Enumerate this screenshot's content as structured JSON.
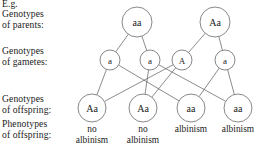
{
  "labels": {
    "eg": "E.g.",
    "parents": "Genotypes\nof parents:",
    "gametes": "Genotypes\nof gametes:",
    "offspring_genotypes": "Genotypes\nof offspring:",
    "offspring_phenotypes": "Phenotypes\nof offspring:"
  },
  "diagram": {
    "parents": [
      {
        "genotype": "aa",
        "cx": 137,
        "cy": 22,
        "r": 15
      },
      {
        "genotype": "Aa",
        "cx": 215,
        "cy": 22,
        "r": 15
      }
    ],
    "gametes": [
      {
        "allele": "a",
        "cx": 110,
        "cy": 60,
        "r": 10
      },
      {
        "allele": "a",
        "cx": 150,
        "cy": 60,
        "r": 10
      },
      {
        "allele": "A",
        "cx": 182,
        "cy": 60,
        "r": 10
      },
      {
        "allele": "a",
        "cx": 225,
        "cy": 60,
        "r": 10
      }
    ],
    "offspring": [
      {
        "genotype": "Aa",
        "cx": 92,
        "cy": 108,
        "r": 14
      },
      {
        "genotype": "Aa",
        "cx": 143,
        "cy": 108,
        "r": 14
      },
      {
        "genotype": "aa",
        "cx": 191,
        "cy": 108,
        "r": 14
      },
      {
        "genotype": "aa",
        "cx": 238,
        "cy": 108,
        "r": 14
      }
    ],
    "parent_to_gamete": [
      {
        "from": 0,
        "to": 0
      },
      {
        "from": 0,
        "to": 1
      },
      {
        "from": 1,
        "to": 2
      },
      {
        "from": 1,
        "to": 3
      }
    ],
    "gamete_to_offspring": [
      {
        "from": 0,
        "to": 0
      },
      {
        "from": 0,
        "to": 2
      },
      {
        "from": 1,
        "to": 1
      },
      {
        "from": 1,
        "to": 3
      },
      {
        "from": 2,
        "to": 0
      },
      {
        "from": 2,
        "to": 1
      },
      {
        "from": 3,
        "to": 2
      },
      {
        "from": 3,
        "to": 3
      }
    ]
  },
  "phenotypes": [
    {
      "text": "no\nalbinism",
      "cx": 92
    },
    {
      "text": "no\nalbinism",
      "cx": 143
    },
    {
      "text": "albinism",
      "cx": 191
    },
    {
      "text": "albinism",
      "cx": 238
    }
  ]
}
